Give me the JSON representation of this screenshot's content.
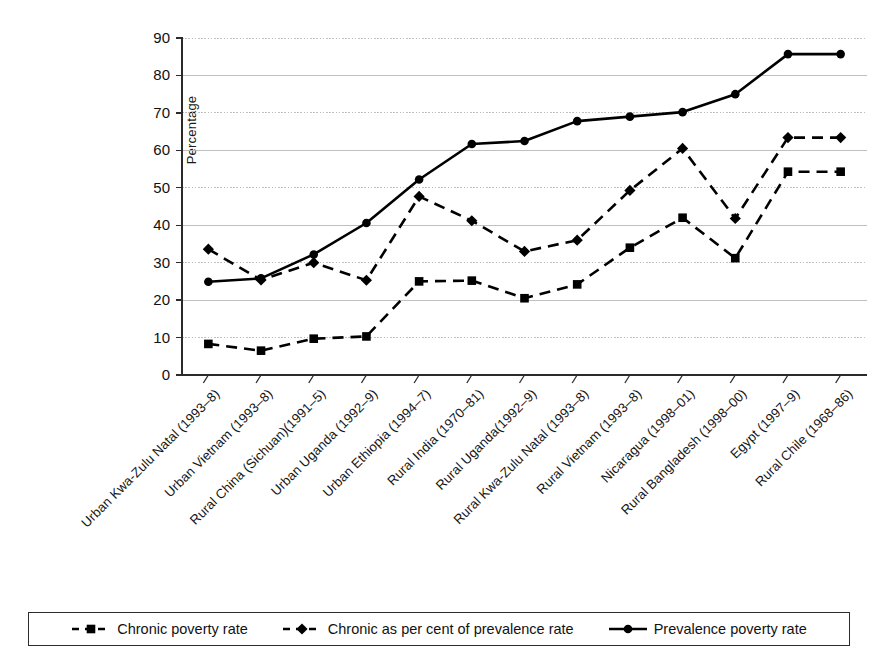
{
  "chart_data": {
    "type": "line",
    "title": "",
    "xlabel": "",
    "ylabel": "Percentage",
    "ylim": [
      0,
      90
    ],
    "ytick_step": 10,
    "yticks": [
      0,
      10,
      20,
      30,
      40,
      50,
      60,
      70,
      80,
      90
    ],
    "grid": true,
    "legend_position": "bottom",
    "categories": [
      "Urban Kwa-Zulu Natal (1993–8)",
      "Urban Vietnam (1993–8)",
      "Rural China (Sichuan)(1991–5)",
      "Urban Uganda (1992–9)",
      "Urban Ethiopia (1994–7)",
      "Rural India (1970–81)",
      "Rural Uganda(1992–9)",
      "Rural Kwa-Zulu Natal (1993–8)",
      "Rural Vietnam (1993–8)",
      "Nicaragua (1998–01)",
      "Rural Bangladesh (1998–00)",
      "Egypt (1997–9)",
      "Rural Chile (1968–86)"
    ],
    "series": [
      {
        "name": "Chronic poverty rate",
        "marker": "square",
        "line": "dashed",
        "color": "#000000",
        "values": [
          8.3,
          6.5,
          9.7,
          10.3,
          25.0,
          25.2,
          20.5,
          24.2,
          34.0,
          42.0,
          31.2,
          54.3,
          54.3
        ]
      },
      {
        "name": "Chronic as per cent of prevalence rate",
        "marker": "diamond",
        "line": "dashed",
        "color": "#000000",
        "values": [
          33.6,
          25.4,
          30.0,
          25.3,
          47.7,
          41.2,
          33.0,
          36.0,
          49.3,
          60.5,
          41.8,
          63.4,
          63.4
        ]
      },
      {
        "name": "Prevalence poverty rate",
        "marker": "circle",
        "line": "solid",
        "color": "#000000",
        "values": [
          24.9,
          25.8,
          32.2,
          40.6,
          52.2,
          61.7,
          62.5,
          67.8,
          69.0,
          70.2,
          75.0,
          85.7,
          85.7
        ]
      }
    ]
  },
  "legend": {
    "items": [
      {
        "label": "Chronic poverty rate",
        "key": "dashed-square"
      },
      {
        "label": "Chronic as per cent of prevalence rate",
        "key": "dashed-diamond"
      },
      {
        "label": "Prevalence poverty rate",
        "key": "solid-circle"
      }
    ]
  },
  "caption": {
    "text": ""
  }
}
